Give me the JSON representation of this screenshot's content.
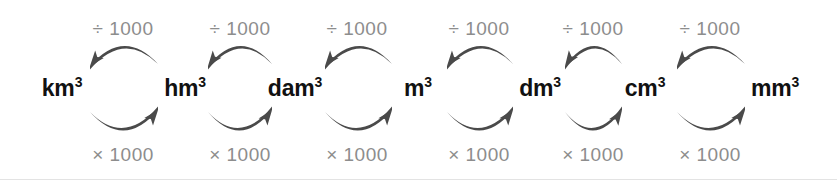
{
  "diagram": {
    "background_color": "#ffffff",
    "arrow_color": "#4a4a4a",
    "unit_text_color": "#111111",
    "operation_text_color": "#8d8d8d",
    "border_color": "#e3e3e3"
  },
  "units": [
    {
      "base": "km",
      "exponent": "3",
      "full": "km3",
      "cx": 62
    },
    {
      "base": "hm",
      "exponent": "3",
      "full": "hm3",
      "cx": 185
    },
    {
      "base": "dam",
      "exponent": "3",
      "full": "dam3",
      "cx": 295
    },
    {
      "base": "m",
      "exponent": "3",
      "full": "m3",
      "cx": 418
    },
    {
      "base": "dm",
      "exponent": "3",
      "full": "dm3",
      "cx": 540
    },
    {
      "base": "cm",
      "exponent": "3",
      "full": "cm3",
      "cx": 645
    },
    {
      "base": "mm",
      "exponent": "3",
      "full": "mm3",
      "cx": 775
    }
  ],
  "top_operations": [
    {
      "label": "÷ 1000",
      "cx": 123
    },
    {
      "label": "÷ 1000",
      "cx": 240
    },
    {
      "label": "÷ 1000",
      "cx": 357
    },
    {
      "label": "÷ 1000",
      "cx": 479
    },
    {
      "label": "÷ 1000",
      "cx": 593
    },
    {
      "label": "÷ 1000",
      "cx": 710
    }
  ],
  "bottom_operations": [
    {
      "label": "× 1000",
      "cx": 123
    },
    {
      "label": "× 1000",
      "cx": 240
    },
    {
      "label": "× 1000",
      "cx": 357
    },
    {
      "label": "× 1000",
      "cx": 479
    },
    {
      "label": "× 1000",
      "cx": 593
    },
    {
      "label": "× 1000",
      "cx": 710
    }
  ],
  "top_arrows": [
    {
      "from": "hm3",
      "to": "km3",
      "direction": "left",
      "x1": 90,
      "x2": 158
    },
    {
      "from": "dam3",
      "to": "hm3",
      "direction": "left",
      "x1": 208,
      "x2": 272
    },
    {
      "from": "m3",
      "to": "dam3",
      "direction": "left",
      "x1": 325,
      "x2": 392
    },
    {
      "from": "dm3",
      "to": "m3",
      "direction": "left",
      "x1": 447,
      "x2": 513
    },
    {
      "from": "cm3",
      "to": "dm3",
      "direction": "left",
      "x1": 565,
      "x2": 622
    },
    {
      "from": "mm3",
      "to": "cm3",
      "direction": "left",
      "x1": 677,
      "x2": 745
    }
  ],
  "bottom_arrows": [
    {
      "from": "km3",
      "to": "hm3",
      "direction": "right",
      "x1": 90,
      "x2": 158
    },
    {
      "from": "hm3",
      "to": "dam3",
      "direction": "right",
      "x1": 208,
      "x2": 272
    },
    {
      "from": "dam3",
      "to": "m3",
      "direction": "right",
      "x1": 325,
      "x2": 392
    },
    {
      "from": "m3",
      "to": "dm3",
      "direction": "right",
      "x1": 447,
      "x2": 513
    },
    {
      "from": "dm3",
      "to": "cm3",
      "direction": "right",
      "x1": 565,
      "x2": 622
    },
    {
      "from": "cm3",
      "to": "mm3",
      "direction": "right",
      "x1": 677,
      "x2": 745
    }
  ],
  "geometry": {
    "top_op_y": 29,
    "top_arrow_y_start": 66,
    "top_arrow_y_peak": 41,
    "unit_y": 88,
    "bottom_arrow_y_start": 110,
    "bottom_arrow_y_peak": 136,
    "bottom_op_y": 155
  }
}
